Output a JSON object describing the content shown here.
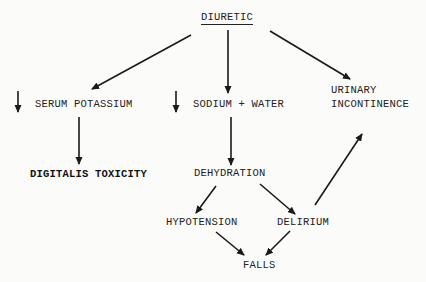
{
  "diagram": {
    "type": "flowchart",
    "nodes": {
      "diuretic": "DIURETIC",
      "serum_potassium": "SERUM POTASSIUM",
      "sodium_water": "SODIUM + WATER",
      "urinary": "URINARY",
      "incontinence": "INCONTINENCE",
      "digitalis_toxicity": "DIGITALIS TOXICITY",
      "dehydration": "DEHYDRATION",
      "hypotension": "HYPOTENSION",
      "delirium": "DELIRIUM",
      "falls": "FALLS"
    },
    "decrease_symbol_meaning": "decrease",
    "edges": [
      {
        "from": "DIURETIC",
        "to": "SERUM POTASSIUM"
      },
      {
        "from": "DIURETIC",
        "to": "SODIUM + WATER"
      },
      {
        "from": "DIURETIC",
        "to": "URINARY INCONTINENCE"
      },
      {
        "from": "SERUM POTASSIUM",
        "to": "DIGITALIS TOXICITY"
      },
      {
        "from": "SODIUM + WATER",
        "to": "DEHYDRATION"
      },
      {
        "from": "DEHYDRATION",
        "to": "HYPOTENSION"
      },
      {
        "from": "DEHYDRATION",
        "to": "DELIRIUM"
      },
      {
        "from": "HYPOTENSION",
        "to": "FALLS"
      },
      {
        "from": "DELIRIUM",
        "to": "FALLS"
      },
      {
        "from": "DELIRIUM",
        "to": "URINARY INCONTINENCE"
      }
    ]
  }
}
